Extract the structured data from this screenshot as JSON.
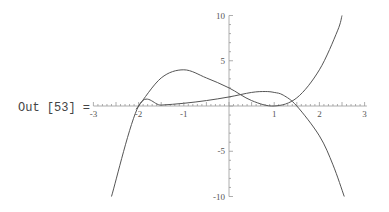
{
  "cell": {
    "label": "Out [53] ="
  },
  "chart_data": {
    "type": "line",
    "title": "",
    "xlabel": "",
    "ylabel": "",
    "xlim": [
      -3,
      3
    ],
    "ylim": [
      -10,
      10
    ],
    "x_ticks": [
      "-3",
      "-2",
      "-1",
      "1",
      "2",
      "3"
    ],
    "y_ticks": [
      "10",
      "5",
      "-5",
      "-10"
    ],
    "grid": false,
    "legend": null,
    "series": [
      {
        "name": "curve-1",
        "x": [
          -2.05,
          -2,
          -1.5,
          -1,
          -0.5,
          0,
          0.5,
          1,
          1.5,
          2,
          2.4,
          2.5
        ],
        "y": [
          -0.3,
          0,
          3.1,
          4,
          3.1,
          2,
          0.6,
          0,
          0.9,
          4,
          8.3,
          10
        ]
      },
      {
        "name": "curve-2",
        "x": [
          -2.6,
          -2,
          -1.5,
          -1,
          -0.5,
          0,
          0.5,
          0.8,
          1,
          1.2,
          1.5,
          2,
          2.3,
          2.55
        ],
        "y": [
          -10,
          0,
          0.1,
          0.3,
          0.6,
          1,
          1.5,
          1.6,
          1.5,
          1.2,
          0,
          -3.3,
          -6.5,
          -10
        ]
      }
    ]
  }
}
